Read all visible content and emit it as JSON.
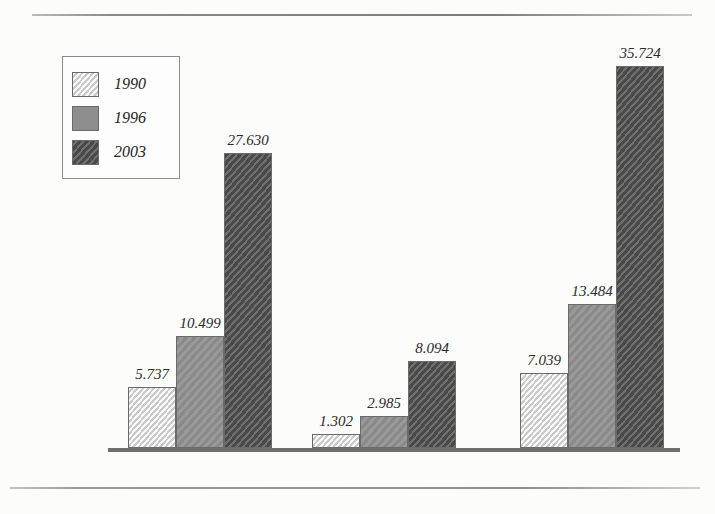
{
  "page": {
    "ghost_text_1": "",
    "ghost_text_2": "",
    "ghost_text_3": "",
    "ghost_text_4": ""
  },
  "legend": {
    "items": [
      {
        "label": "1990",
        "color": "#dcdcdc",
        "swatch_name": "legend-swatch-1990"
      },
      {
        "label": "1996",
        "color": "#8e8e8e",
        "swatch_name": "legend-swatch-1996"
      },
      {
        "label": "2003",
        "color": "#555555",
        "swatch_name": "legend-swatch-2003"
      }
    ]
  },
  "chart_data": {
    "type": "bar",
    "title": "",
    "xlabel": "",
    "ylabel": "",
    "grid": false,
    "legend_position": "top-left",
    "ylim": [
      0,
      35724
    ],
    "categories": [
      "Mestrado",
      "Doutorado",
      "Total"
    ],
    "series": [
      {
        "name": "1990",
        "color": "#dcdcdc",
        "values": [
          5737,
          10499,
          27630
        ],
        "labels": [
          "5.737",
          "1.302",
          "7.039"
        ]
      },
      {
        "name": "1996",
        "color": "#8e8e8e",
        "values": [
          10499,
          2985,
          13484
        ],
        "labels": [
          "10.499",
          "2.985",
          "13.484"
        ]
      },
      {
        "name": "2003",
        "color": "#555555",
        "values": [
          27630,
          8094,
          35724
        ],
        "labels": [
          "27.630",
          "8.094",
          "35.724"
        ]
      }
    ],
    "groups": [
      {
        "category": "Mestrado",
        "bars": [
          {
            "series": "1990",
            "value": 5737,
            "label": "5.737"
          },
          {
            "series": "1996",
            "value": 10499,
            "label": "10.499"
          },
          {
            "series": "2003",
            "value": 27630,
            "label": "27.630"
          }
        ]
      },
      {
        "category": "Doutorado",
        "bars": [
          {
            "series": "1990",
            "value": 1302,
            "label": "1.302"
          },
          {
            "series": "1996",
            "value": 2985,
            "label": "2.985"
          },
          {
            "series": "2003",
            "value": 8094,
            "label": "8.094"
          }
        ]
      },
      {
        "category": "Total",
        "bars": [
          {
            "series": "1990",
            "value": 7039,
            "label": "7.039"
          },
          {
            "series": "1996",
            "value": 13484,
            "label": "13.484"
          },
          {
            "series": "2003",
            "value": 35724,
            "label": "35.724"
          }
        ]
      }
    ]
  }
}
